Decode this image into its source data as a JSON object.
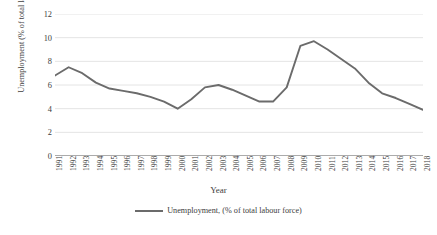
{
  "chart_data": {
    "type": "line",
    "title": "",
    "xlabel": "Year",
    "ylabel": "Unemployment (% of total labour force)",
    "ylim": [
      0,
      12
    ],
    "yticks": [
      0,
      2,
      4,
      6,
      8,
      10,
      12
    ],
    "grid": true,
    "legend_position": "bottom",
    "legend": [
      "Unemployment, (% of total labour force)"
    ],
    "line_color": "#6b6b6b",
    "categories": [
      "1991",
      "1992",
      "1993",
      "1994",
      "1995",
      "1996",
      "1997",
      "1998",
      "1999",
      "2000",
      "2001",
      "2002",
      "2003",
      "2004",
      "2005",
      "2006",
      "2007",
      "2008",
      "2009",
      "2010",
      "2011",
      "2012",
      "2013",
      "2014",
      "2015",
      "2016",
      "2017",
      "2018"
    ],
    "series": [
      {
        "name": "Unemployment, (% of total labour force)",
        "values": [
          6.8,
          7.5,
          7.0,
          6.2,
          5.7,
          5.5,
          5.3,
          5.0,
          4.6,
          4.0,
          4.8,
          5.8,
          6.0,
          5.6,
          5.1,
          4.6,
          4.6,
          5.8,
          9.3,
          9.7,
          9.0,
          8.2,
          7.4,
          6.2,
          5.3,
          4.9,
          4.4,
          3.9
        ]
      }
    ]
  },
  "axes": {
    "y_title": "Unemployment (% of total labour force)",
    "x_title": "Year"
  },
  "legend": {
    "entry_label": "Unemployment, (% of total labour force)"
  },
  "colors": {
    "line": "#6b6b6b",
    "grid": "#e4e4e4",
    "axis": "#595959",
    "text": "#404040"
  }
}
